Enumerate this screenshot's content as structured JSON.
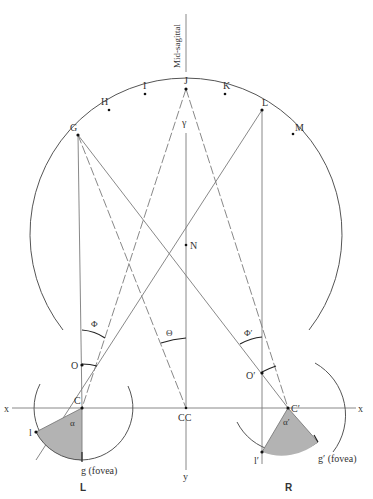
{
  "midline_label": "Mid-sagittal",
  "horopter_points": [
    {
      "label": "G",
      "x": 78,
      "y": 135
    },
    {
      "label": "H",
      "x": 109,
      "y": 110
    },
    {
      "label": "I",
      "x": 145,
      "y": 94
    },
    {
      "label": "J",
      "x": 186,
      "y": 89
    },
    {
      "label": "K",
      "x": 225,
      "y": 94
    },
    {
      "label": "L",
      "x": 262,
      "y": 110
    },
    {
      "label": "M",
      "x": 293,
      "y": 134
    }
  ],
  "labels": {
    "gamma": "γ",
    "N": "N",
    "phi": "Φ",
    "phi_prime": "Φ′",
    "theta": "Θ",
    "O": "O",
    "O_prime": "O′",
    "C": "C",
    "C_prime": "C′",
    "CC": "CC",
    "x_left": "x",
    "x_right": "x",
    "y": "y",
    "alpha": "α",
    "alpha_prime": "α′",
    "l": "l",
    "l_prime": "l′",
    "g_fovea": "g (fovea)",
    "g_prime_fovea": "g′ (fovea)",
    "left_eye": "L",
    "right_eye": "R"
  },
  "colors": {
    "line": "#7a7a7a",
    "arc": "#555555",
    "retina_fill": "#b3b3b3",
    "text": "#333333"
  }
}
